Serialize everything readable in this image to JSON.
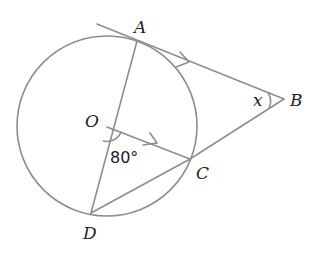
{
  "diagram": {
    "type": "geometry",
    "colors": {
      "line": "#8e8e8e",
      "text": "#222222",
      "background": "#ffffff"
    },
    "circle": {
      "center": "O",
      "cx": 107,
      "cy": 126,
      "r": 90
    },
    "points": {
      "A": {
        "label": "A",
        "x": 137,
        "y": 41
      },
      "B": {
        "label": "B",
        "x": 284,
        "y": 99
      },
      "C": {
        "label": "C",
        "x": 190,
        "y": 159
      },
      "D": {
        "label": "D",
        "x": 91,
        "y": 213
      },
      "O": {
        "label": "O",
        "x": 107,
        "y": 127
      }
    },
    "segments": [
      "AB (tangent, extended)",
      "AD",
      "OC",
      "DC",
      "CB"
    ],
    "parallel_marks": [
      "AB",
      "OC"
    ],
    "angles": {
      "AOC": {
        "label": "80°",
        "value_deg": 80
      },
      "ABC": {
        "label": "x"
      }
    }
  }
}
